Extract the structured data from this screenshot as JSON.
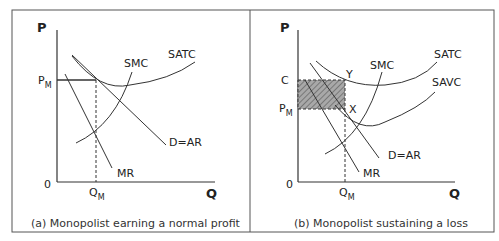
{
  "panels": [
    {
      "id": "a",
      "caption": "(a) Monopolist earning a normal profit",
      "y_axis": "P",
      "x_axis": "Q",
      "origin": "0",
      "price_label": "P",
      "price_sub": "M",
      "qty_label": "Q",
      "qty_sub": "M",
      "curves": {
        "satc": "SATC",
        "smc": "SMC",
        "demand": "D=AR",
        "mr": "MR"
      }
    },
    {
      "id": "b",
      "caption": "(b) Monopolist sustaining a loss",
      "y_axis": "P",
      "x_axis": "Q",
      "origin": "0",
      "cost_label": "C",
      "price_label": "P",
      "price_sub": "M",
      "qty_label": "Q",
      "qty_sub": "M",
      "point_y": "Y",
      "point_x": "X",
      "curves": {
        "satc": "SATC",
        "savc": "SAVC",
        "smc": "SMC",
        "demand": "D=AR",
        "mr": "MR"
      }
    }
  ],
  "colors": {
    "line": "#333333",
    "border": "#555555",
    "shade": "#999999"
  }
}
